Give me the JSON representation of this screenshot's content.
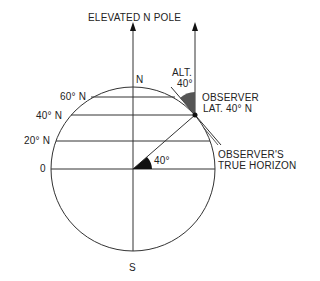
{
  "title": "ELEVATED N POLE",
  "labels": {
    "north": "N",
    "south": "S",
    "lat60": "60° N",
    "lat40": "40° N",
    "lat20": "20° N",
    "equator": "0",
    "alt_line1": "ALT.",
    "alt_line2": "40°",
    "observer_line1": "OBSERVER",
    "observer_line2": "LAT. 40° N",
    "horizon_line1": "OBSERVER'S",
    "horizon_line2": "TRUE HORIZON",
    "center_angle": "40°"
  },
  "colors": {
    "line": "#333333",
    "fill_dark": "#111111",
    "fill_alt": "#555555"
  }
}
